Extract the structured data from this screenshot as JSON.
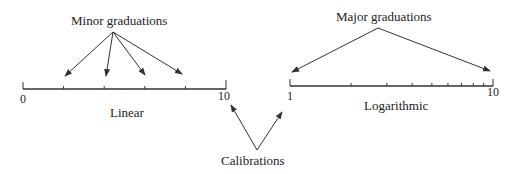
{
  "labels": {
    "minor": "Minor graduations",
    "major": "Major graduations",
    "linear": "Linear",
    "log": "Logarithmic",
    "calibrations": "Calibrations"
  },
  "linear_scale": {
    "start_label": "0",
    "end_label": "10",
    "x0": 23,
    "x1": 226,
    "y": 89,
    "minor_ticks": [
      2,
      4,
      6,
      8
    ]
  },
  "log_scale": {
    "start_label": "1",
    "end_label": "10",
    "x0": 290,
    "x1": 493,
    "y": 86,
    "ticks": [
      2,
      3,
      4,
      5,
      6,
      7,
      8,
      9
    ]
  },
  "arrows": {
    "minor": {
      "from": [
        113,
        32
      ],
      "to": [
        [
          65,
          76
        ],
        [
          106,
          76
        ],
        [
          145,
          75
        ],
        [
          182,
          74
        ]
      ]
    },
    "major": {
      "from": [
        378,
        28
      ],
      "to": [
        [
          292,
          72
        ],
        [
          490,
          71
        ]
      ]
    },
    "calibrations": {
      "from": [
        257,
        150
      ],
      "to": [
        [
          231,
          105
        ],
        [
          282,
          112
        ]
      ]
    }
  },
  "colors": {
    "ink": "#333333",
    "background": "#ffffff"
  }
}
